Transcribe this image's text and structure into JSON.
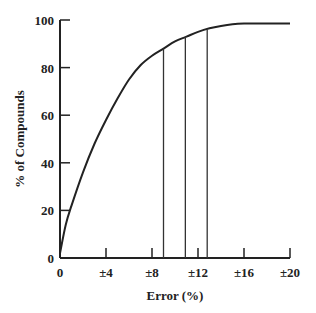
{
  "chart_data": {
    "type": "line",
    "title": "",
    "xlabel": "Error (%)",
    "ylabel": "% of Compounds",
    "xlim": [
      0,
      20
    ],
    "ylim": [
      0,
      100
    ],
    "grid": false,
    "legend": null,
    "x_ticks": [
      {
        "value": 0,
        "label": "0"
      },
      {
        "value": 4,
        "label": "±4"
      },
      {
        "value": 8,
        "label": "±8"
      },
      {
        "value": 12,
        "label": "±12"
      },
      {
        "value": 16,
        "label": "±16"
      },
      {
        "value": 20,
        "label": "±20"
      }
    ],
    "y_ticks": [
      {
        "value": 0,
        "label": "0"
      },
      {
        "value": 20,
        "label": "20"
      },
      {
        "value": 40,
        "label": "40"
      },
      {
        "value": 60,
        "label": "60"
      },
      {
        "value": 80,
        "label": "80"
      },
      {
        "value": 100,
        "label": "100"
      }
    ],
    "series": [
      {
        "name": "cumulative % of compounds",
        "x": [
          0,
          0.5,
          1,
          2,
          3,
          4,
          5,
          6,
          7,
          8,
          9,
          10,
          11,
          12,
          13,
          14,
          15,
          16,
          17,
          18,
          19,
          20
        ],
        "y": [
          2,
          14,
          22,
          36,
          48,
          58,
          67,
          75,
          81,
          85,
          88,
          91,
          93,
          95,
          96.5,
          97.5,
          98.2,
          98.5,
          98.5,
          98.5,
          98.5,
          98.5
        ]
      }
    ],
    "annotations": [
      {
        "type": "vertical-line",
        "x": 9.0,
        "y_top": 88
      },
      {
        "type": "vertical-line",
        "x": 10.9,
        "y_top": 93
      },
      {
        "type": "vertical-line",
        "x": 12.8,
        "y_top": 96
      }
    ]
  }
}
